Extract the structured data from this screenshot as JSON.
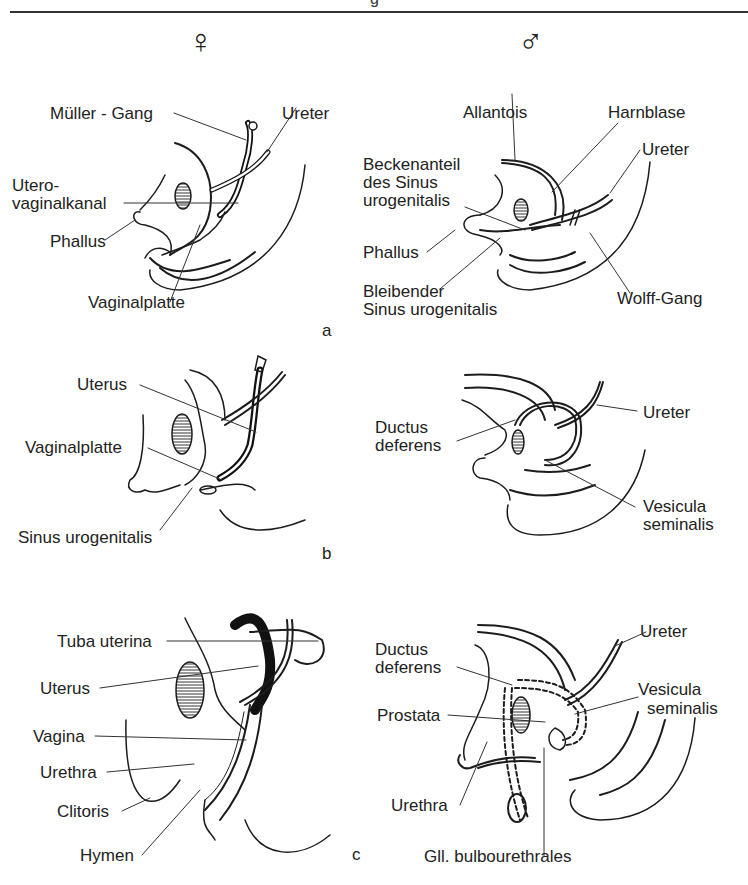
{
  "header": {
    "fragment": "g"
  },
  "symbols": {
    "female": "♀",
    "male": "♂"
  },
  "panels": {
    "a": {
      "letter": "a",
      "female": [
        "Müller - Gang",
        "Ureter",
        "Utero-",
        "vaginalkanal",
        "Phallus",
        "Vaginalplatte"
      ],
      "male": [
        "Allantois",
        "Harnblase",
        "Beckenanteil",
        "des Sinus",
        "urogenitalis",
        "Ureter",
        "Phallus",
        "Bleibender",
        "Sinus urogenitalis",
        "Wolff-Gang"
      ]
    },
    "b": {
      "letter": "b",
      "female": [
        "Uterus",
        "Vaginalplatte",
        "Sinus urogenitalis"
      ],
      "male": [
        "Ductus",
        "deferens",
        "Ureter",
        "Vesicula",
        "seminalis"
      ]
    },
    "c": {
      "letter": "c",
      "female": [
        "Tuba uterina",
        "Uterus",
        "Vagina",
        "Urethra",
        "Clitoris",
        "Hymen"
      ],
      "male": [
        "Ductus",
        "deferens",
        "Ureter",
        "Vesicula",
        "seminalis",
        "Prostata",
        "Urethra",
        "Gll. bulbourethrales"
      ]
    }
  }
}
